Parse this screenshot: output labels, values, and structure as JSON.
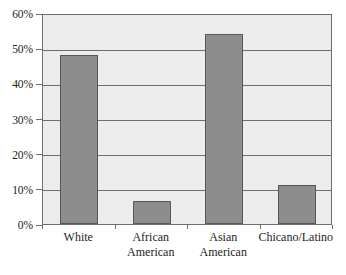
{
  "chart_data": {
    "type": "bar",
    "title": "",
    "subtitle": "",
    "xlabel": "",
    "ylabel": "",
    "categories": [
      "White",
      "African American",
      "Asian American",
      "Chicano/Latino"
    ],
    "category_lines": [
      [
        "White"
      ],
      [
        "African",
        "American"
      ],
      [
        "Asian",
        "American"
      ],
      [
        "Chicano/Latino"
      ]
    ],
    "values": [
      48,
      6.5,
      54,
      11
    ],
    "value_labels": [
      "48%",
      "6.5%",
      "54%",
      "11%"
    ],
    "ylim": [
      0,
      60
    ],
    "ytick_values": [
      0,
      10,
      20,
      30,
      40,
      50,
      60
    ],
    "ytick_labels": [
      "0%",
      "10%",
      "20%",
      "30%",
      "40%",
      "50%",
      "60%"
    ],
    "grid": true,
    "grid_orientation": "horizontal",
    "legend": false,
    "legend_position": "none",
    "annotations": []
  },
  "style": {
    "bar_fill": "#8d8d8d",
    "bar_border": "#575757",
    "plot_background": "#ebeceb",
    "axis_color": "#6e6e6e",
    "grid_color": "#6e6e6e",
    "text_color": "#1c1c1c",
    "figure_background": "#ffffff"
  }
}
